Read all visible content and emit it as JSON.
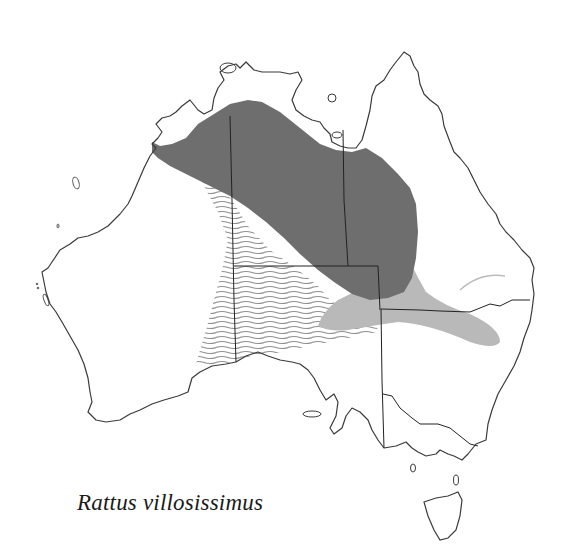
{
  "figure": {
    "type": "species distribution map",
    "region": "Australia",
    "species_label": "Rattus villosissimus"
  },
  "legend_zones": [
    {
      "name": "core-range",
      "fill": "#6e6e6e",
      "style": "solid dark grey"
    },
    {
      "name": "irruption-range",
      "fill": "#b9b9b9",
      "style": "solid light grey"
    },
    {
      "name": "hatched-range",
      "stroke": "#8a8a8a",
      "style": "wavy horizontal lines"
    }
  ],
  "colors": {
    "background": "#ffffff",
    "coastline": "#3a3a3a",
    "borders": "#222222",
    "core": "#6e6e6e",
    "light": "#b9b9b9",
    "hatch": "#8a8a8a"
  }
}
